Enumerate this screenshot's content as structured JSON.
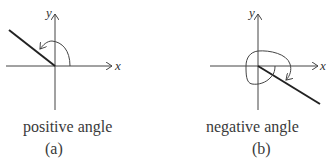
{
  "panels": [
    {
      "id": "a",
      "caption": "positive angle",
      "sublabel": "(a)",
      "x_axis_label": "x",
      "y_axis_label": "y",
      "rotation": "counterclockwise"
    },
    {
      "id": "b",
      "caption": "negative angle",
      "sublabel": "(b)",
      "x_axis_label": "x",
      "y_axis_label": "y",
      "rotation": "clockwise"
    }
  ],
  "colors": {
    "line": "#222222",
    "axis": "#444444"
  }
}
